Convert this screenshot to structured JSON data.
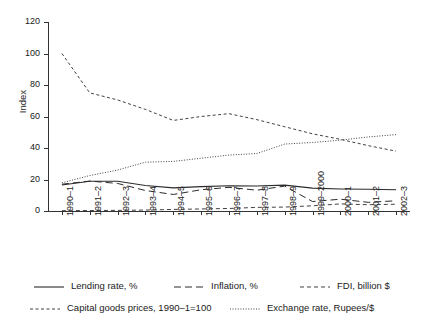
{
  "chart_data": {
    "type": "line",
    "title": "",
    "xlabel": "",
    "ylabel": "Index",
    "ylim": [
      0,
      120
    ],
    "yticks": [
      0,
      20,
      40,
      60,
      80,
      100,
      120
    ],
    "grid": false,
    "legend_position": "bottom",
    "categories": [
      "1990–1",
      "1991–2",
      "1992–3",
      "1993–4",
      "1994–5",
      "1995–6",
      "1996–7",
      "1997–8",
      "1998–9",
      "1999–2000",
      "2000–1",
      "2001–2",
      "2002–3"
    ],
    "series": [
      {
        "name": "Lending rate, %",
        "style": "solid",
        "values": [
          16.5,
          18.9,
          18.9,
          16.2,
          14.7,
          15.5,
          16.0,
          15.9,
          16.4,
          14.5,
          14.0,
          13.8,
          13.5
        ]
      },
      {
        "name": "Inflation, %",
        "style": "long-dash",
        "values": [
          17.0,
          19.0,
          17.5,
          13.0,
          10.5,
          13.5,
          15.0,
          13.2,
          15.8,
          6.0,
          7.5,
          5.5,
          6.5
        ]
      },
      {
        "name": "FDI, billion $",
        "style": "short-dash",
        "values": [
          0.2,
          0.3,
          0.4,
          0.6,
          1.0,
          1.3,
          1.6,
          2.3,
          2.5,
          3.3,
          4.5,
          4.0,
          4.3
        ]
      },
      {
        "name": "Capital goods prices, 1990–1=100",
        "style": "dashed",
        "values": [
          100.0,
          75.0,
          70.5,
          64.5,
          57.5,
          60.0,
          61.8,
          58.0,
          53.5,
          49.0,
          45.5,
          41.5,
          38.0
        ]
      },
      {
        "name": "Exchange rate, Rupees/$",
        "style": "dotted",
        "values": [
          17.9,
          22.5,
          26.0,
          31.0,
          31.5,
          33.5,
          35.5,
          36.5,
          42.5,
          43.5,
          45.0,
          47.0,
          48.5
        ]
      }
    ]
  }
}
